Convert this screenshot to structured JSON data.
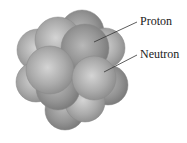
{
  "diagram": {
    "labels": [
      {
        "text": "Proton",
        "x": 140,
        "y": 15
      },
      {
        "text": "Neutron",
        "x": 140,
        "y": 48
      }
    ],
    "colors": {
      "sphere_light": "#d6d6d6",
      "sphere_mid": "#a9a9a9",
      "sphere_dark": "#7f7f7f",
      "leader_line": "#333333",
      "label_text": "#222222"
    }
  }
}
